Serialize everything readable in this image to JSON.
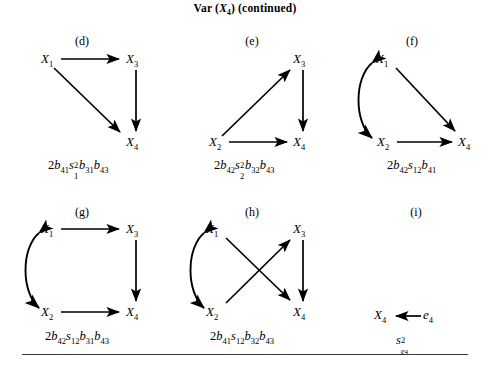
{
  "figure": {
    "title_prefix": "Var (",
    "title_var": "X",
    "title_var_sub": "4",
    "title_suffix": ") (continued)",
    "rule_visible": true
  },
  "panels": [
    {
      "id": "d",
      "label": "(d)",
      "nodes": [
        {
          "name": "X1",
          "symbol": "X",
          "sub": "1"
        },
        {
          "name": "X3",
          "symbol": "X",
          "sub": "3"
        },
        {
          "name": "X4",
          "symbol": "X",
          "sub": "4"
        }
      ],
      "edges": [
        {
          "from": "X1",
          "to": "X3",
          "kind": "directed"
        },
        {
          "from": "X1",
          "to": "X4",
          "kind": "directed"
        },
        {
          "from": "X3",
          "to": "X4",
          "kind": "directed"
        }
      ],
      "formula": "2b41s1^2b31b43",
      "formula_parts": [
        {
          "t": "2",
          "style": "plain"
        },
        {
          "t": "b",
          "style": "ital",
          "sub": "41"
        },
        {
          "t": "s",
          "style": "ital",
          "sub": "1",
          "sup": "2"
        },
        {
          "t": "b",
          "style": "ital",
          "sub": "31"
        },
        {
          "t": "b",
          "style": "ital",
          "sub": "43"
        }
      ]
    },
    {
      "id": "e",
      "label": "(e)",
      "nodes": [
        {
          "name": "X2",
          "symbol": "X",
          "sub": "2"
        },
        {
          "name": "X3",
          "symbol": "X",
          "sub": "3"
        },
        {
          "name": "X4",
          "symbol": "X",
          "sub": "4"
        }
      ],
      "edges": [
        {
          "from": "X2",
          "to": "X3",
          "kind": "directed"
        },
        {
          "from": "X2",
          "to": "X4",
          "kind": "directed"
        },
        {
          "from": "X3",
          "to": "X4",
          "kind": "directed"
        }
      ],
      "formula": "2b42s2^2b32b43",
      "formula_parts": [
        {
          "t": "2",
          "style": "plain"
        },
        {
          "t": "b",
          "style": "ital",
          "sub": "42"
        },
        {
          "t": "s",
          "style": "ital",
          "sub": "2",
          "sup": "2"
        },
        {
          "t": "b",
          "style": "ital",
          "sub": "32"
        },
        {
          "t": "b",
          "style": "ital",
          "sub": "43"
        }
      ]
    },
    {
      "id": "f",
      "label": "(f)",
      "nodes": [
        {
          "name": "X1",
          "symbol": "X",
          "sub": "1"
        },
        {
          "name": "X2",
          "symbol": "X",
          "sub": "2"
        },
        {
          "name": "X4",
          "symbol": "X",
          "sub": "4"
        }
      ],
      "edges": [
        {
          "from": "X1",
          "to": "X2",
          "kind": "curved-double"
        },
        {
          "from": "X1",
          "to": "X4",
          "kind": "directed"
        },
        {
          "from": "X2",
          "to": "X4",
          "kind": "directed"
        }
      ],
      "formula": "2b42s12b41",
      "formula_parts": [
        {
          "t": "2",
          "style": "plain"
        },
        {
          "t": "b",
          "style": "ital",
          "sub": "42"
        },
        {
          "t": "s",
          "style": "ital",
          "sub": "12"
        },
        {
          "t": "b",
          "style": "ital",
          "sub": "41"
        }
      ]
    },
    {
      "id": "g",
      "label": "(g)",
      "nodes": [
        {
          "name": "X1",
          "symbol": "X",
          "sub": "1"
        },
        {
          "name": "X2",
          "symbol": "X",
          "sub": "2"
        },
        {
          "name": "X3",
          "symbol": "X",
          "sub": "3"
        },
        {
          "name": "X4",
          "symbol": "X",
          "sub": "4"
        }
      ],
      "edges": [
        {
          "from": "X1",
          "to": "X2",
          "kind": "curved-double"
        },
        {
          "from": "X1",
          "to": "X3",
          "kind": "directed"
        },
        {
          "from": "X2",
          "to": "X4",
          "kind": "directed"
        },
        {
          "from": "X3",
          "to": "X4",
          "kind": "directed"
        }
      ],
      "formula": "2b42s12b31b43",
      "formula_parts": [
        {
          "t": "2",
          "style": "plain"
        },
        {
          "t": "b",
          "style": "ital",
          "sub": "42"
        },
        {
          "t": "s",
          "style": "ital",
          "sub": "12"
        },
        {
          "t": "b",
          "style": "ital",
          "sub": "31"
        },
        {
          "t": "b",
          "style": "ital",
          "sub": "43"
        }
      ]
    },
    {
      "id": "h",
      "label": "(h)",
      "nodes": [
        {
          "name": "X1",
          "symbol": "X",
          "sub": "1"
        },
        {
          "name": "X2",
          "symbol": "X",
          "sub": "2"
        },
        {
          "name": "X3",
          "symbol": "X",
          "sub": "3"
        },
        {
          "name": "X4",
          "symbol": "X",
          "sub": "4"
        }
      ],
      "edges": [
        {
          "from": "X1",
          "to": "X2",
          "kind": "curved-double"
        },
        {
          "from": "X1",
          "to": "X4",
          "kind": "directed"
        },
        {
          "from": "X2",
          "to": "X3",
          "kind": "directed"
        },
        {
          "from": "X3",
          "to": "X4",
          "kind": "directed"
        }
      ],
      "formula": "2b41s12b32b43",
      "formula_parts": [
        {
          "t": "2",
          "style": "plain"
        },
        {
          "t": "b",
          "style": "ital",
          "sub": "41"
        },
        {
          "t": "s",
          "style": "ital",
          "sub": "12"
        },
        {
          "t": "b",
          "style": "ital",
          "sub": "32"
        },
        {
          "t": "b",
          "style": "ital",
          "sub": "43"
        }
      ]
    },
    {
      "id": "i",
      "label": "(i)",
      "nodes": [
        {
          "name": "X4",
          "symbol": "X",
          "sub": "4"
        },
        {
          "name": "e4",
          "symbol": "e",
          "sub": "4"
        }
      ],
      "edges": [
        {
          "from": "e4",
          "to": "X4",
          "kind": "directed"
        }
      ],
      "formula": "s_e4^2",
      "formula_parts": [
        {
          "t": "s",
          "style": "ital",
          "sub": "e4",
          "sup": "2"
        }
      ]
    }
  ],
  "labels": {
    "d": "(d)",
    "e": "(e)",
    "f": "(f)",
    "g": "(g)",
    "h": "(h)",
    "i": "(i)"
  },
  "nodes_text": {
    "X1": "X",
    "X2": "X",
    "X3": "X",
    "X4": "X",
    "e4": "e"
  },
  "colors": {
    "ink": "#000000",
    "rule": "#3a3a3a",
    "background": "#ffffff"
  }
}
